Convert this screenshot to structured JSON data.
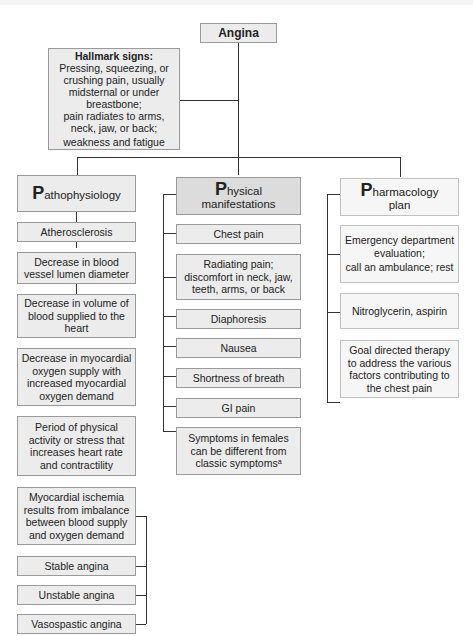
{
  "root": {
    "label": "Angina"
  },
  "hallmark": {
    "bold_label": "Hallmark signs:",
    "lines": [
      " Pressing, squeezing, or crushing pain, usually midsternal or under breastbone;",
      "pain radiates to arms, neck, jaw, or back;",
      "weakness and fatigue"
    ]
  },
  "columns": {
    "pathophysiology": {
      "initial": "P",
      "rest": "athophysiology",
      "items": [
        "Atherosclerosis",
        "Decrease in blood vessel lumen diameter",
        "Decrease in volume of blood supplied to the heart",
        "Decrease in myocardial oxygen supply with increased myocardial oxygen demand",
        "Period of physical activity or stress that increases heart rate and contractility",
        "Myocardial ischemia results from imbalance between blood supply and oxygen demand",
        "Stable angina",
        "Unstable angina",
        "Vasospastic angina"
      ]
    },
    "physical": {
      "initial": "P",
      "rest_line1": "hysical",
      "line2": "manifestations",
      "items": [
        "Chest pain",
        "Radiating pain; discomfort in neck, jaw, teeth, arms, or back",
        "Diaphoresis",
        "Nausea",
        "Shortness of breath",
        "GI pain",
        "Symptoms in females can be different from classic symptomsᵃ"
      ]
    },
    "pharmacology": {
      "initial": "P",
      "rest_line1": "harmacology",
      "line2": "plan",
      "items": [
        "Emergency department evaluation;",
        "call an ambulance; rest",
        "Nitroglycerin, aspirin",
        "Goal directed therapy to address the various factors contributing to the chest pain"
      ]
    }
  },
  "colors": {
    "box_fill": "#ececec",
    "box_fill_dark": "#dcdcdc",
    "box_fill_light": "#f6f6f6",
    "border": "#9a9a9a",
    "connector": "#333333"
  }
}
